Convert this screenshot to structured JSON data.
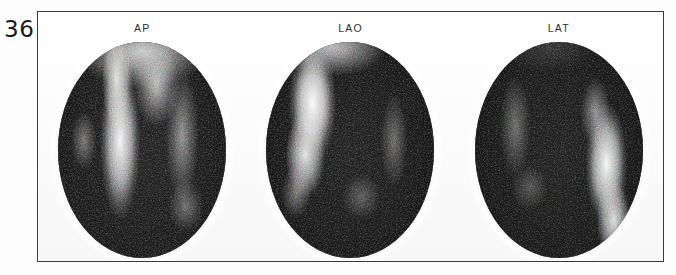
{
  "page": {
    "number": "36",
    "background_color": "#ffffff"
  },
  "figure": {
    "border_color": "#3a3a3a",
    "modality": "nuclear-medicine-scintigraphy",
    "panels": [
      {
        "label": "AP",
        "icon": "scintigram-oval",
        "view_name": "anteroposterior",
        "description": "Grainy dark oval scintigram with two vertical bright uptake stripes left of midline"
      },
      {
        "label": "LAO",
        "icon": "scintigram-oval",
        "view_name": "left-anterior-oblique",
        "description": "Grainy dark oval scintigram with one broad bright uptake band in the upper-left quadrant"
      },
      {
        "label": "LAT",
        "icon": "scintigram-oval",
        "view_name": "lateral",
        "description": "Grainy dark oval scintigram with a bright uptake band along the right margin"
      }
    ]
  }
}
